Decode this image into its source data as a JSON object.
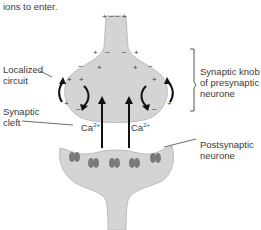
{
  "caption_fragment": "ions to enter.",
  "labels": {
    "localized_circuit": "Localized\ncircuit",
    "synaptic_cleft": "Synaptic\ncleft",
    "synaptic_knob": "Synaptic knob\nof presynaptic\nneurone",
    "postsynaptic": "Postsynaptic\nneurone"
  },
  "ions": {
    "left": "Ca",
    "right": "Ca",
    "charge": "2+"
  },
  "colors": {
    "neurone_fill": "#d4d4d4",
    "neurone_stroke": "#b8b8b8",
    "receptor": "#7a7a7a",
    "arrow": "#111111"
  }
}
